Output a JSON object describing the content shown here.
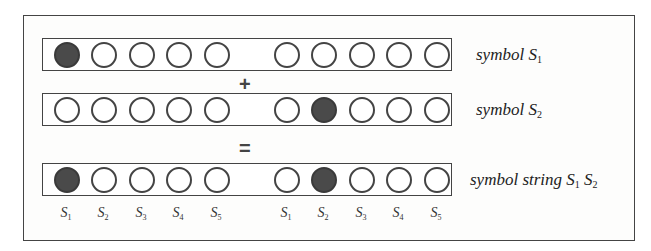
{
  "diagram": {
    "rows": [
      {
        "name": "symbol-s1",
        "label_text": "symbol S",
        "label_sub": "1",
        "filled": [
          true,
          false,
          false,
          false,
          false,
          false,
          false,
          false,
          false,
          false
        ]
      },
      {
        "name": "symbol-s2",
        "label_text": "symbol S",
        "label_sub": "2",
        "filled": [
          false,
          false,
          false,
          false,
          false,
          false,
          true,
          false,
          false,
          false
        ]
      },
      {
        "name": "symbol-string-s1s2",
        "label_text": "symbol string S",
        "label_sub": "1",
        "label_text2": " S",
        "label_sub2": "2",
        "filled": [
          true,
          false,
          false,
          false,
          false,
          false,
          true,
          false,
          false,
          false
        ]
      }
    ],
    "operators": {
      "plus": "+",
      "equals": "="
    },
    "index_labels": [
      {
        "base": "S",
        "sub": "1"
      },
      {
        "base": "S",
        "sub": "2"
      },
      {
        "base": "S",
        "sub": "3"
      },
      {
        "base": "S",
        "sub": "4"
      },
      {
        "base": "S",
        "sub": "5"
      },
      {
        "base": "S",
        "sub": "1"
      },
      {
        "base": "S",
        "sub": "2"
      },
      {
        "base": "S",
        "sub": "3"
      },
      {
        "base": "S",
        "sub": "4"
      },
      {
        "base": "S",
        "sub": "5"
      }
    ],
    "colors": {
      "filled": "#4a4a4a",
      "stroke": "#444444",
      "background": "#ffffff"
    }
  }
}
